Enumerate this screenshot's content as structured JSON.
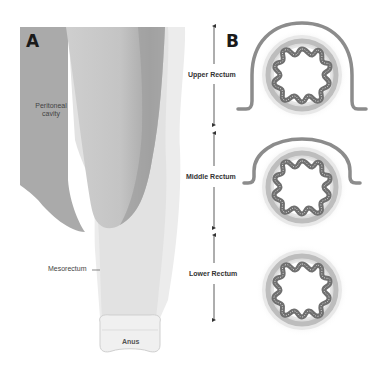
{
  "panels": {
    "a": {
      "letter": "A"
    },
    "b": {
      "letter": "B"
    }
  },
  "labels": {
    "peritoneal_cavity": "Peritoneal cavity",
    "peritoneal_line1": "Peritoneal",
    "peritoneal_line2": "cavity",
    "mesorectum": "Mesorectum",
    "anus": "Anus"
  },
  "regions": [
    {
      "label": "Upper Rectum"
    },
    {
      "label": "Middle Rectum"
    },
    {
      "label": "Lower Rectum"
    }
  ],
  "colors": {
    "peritoneum": "#a9a9a9",
    "rectum_dark": "#b5b5b5",
    "mesorectum": "#e6e6e6",
    "mucosa": "#6f6f6f",
    "muscle_ring": "#bdbdbd",
    "serosa": "#8c8c8c"
  }
}
